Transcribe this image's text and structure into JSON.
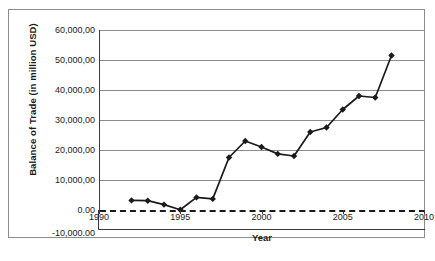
{
  "chart_data": {
    "type": "line",
    "title": "",
    "xlabel": "Year",
    "ylabel": "Balance of Trade  (in million USD)",
    "xlim": [
      1990,
      2010
    ],
    "ylim": [
      -10000,
      60000
    ],
    "grid": true,
    "legend": "none",
    "x": [
      1992,
      1993,
      1994,
      1995,
      1996,
      1997,
      1998,
      1999,
      2000,
      2001,
      2002,
      2003,
      2004,
      2005,
      2006,
      2007,
      2008
    ],
    "values": [
      3200,
      3100,
      1800,
      100,
      4200,
      3700,
      17500,
      23000,
      21000,
      18700,
      18000,
      26000,
      27500,
      33500,
      38000,
      37500,
      51500
    ],
    "series": [
      {
        "name": "Balance of Trade",
        "values": [
          3200,
          3100,
          1800,
          100,
          4200,
          3700,
          17500,
          23000,
          21000,
          18700,
          18000,
          26000,
          27500,
          33500,
          38000,
          37500,
          51500
        ]
      }
    ],
    "y_ticks": [
      60000,
      50000,
      40000,
      30000,
      20000,
      10000,
      0,
      -10000
    ],
    "y_tick_labels": [
      "60,000,00",
      "50,000,00",
      "40,000,00",
      "30,000,00",
      "20,000,00",
      "10,000,00",
      "0.00",
      "-10,000.00"
    ],
    "x_ticks": [
      1990,
      1995,
      2000,
      2005,
      2010
    ],
    "x_tick_labels": [
      "1990",
      "1995",
      "2000",
      "2005",
      "2010"
    ],
    "annotations": [
      {
        "name": "zero-reference-line",
        "value": 0,
        "style": "dashed"
      }
    ],
    "colors": {
      "line": "#1a1a1a",
      "marker": "#1a1a1a",
      "gridline": "#8c8c8c",
      "axis": "#3a3a3a",
      "background": "#ffffff",
      "frame": "#8d8d8d"
    }
  },
  "figure": {
    "caption": ""
  }
}
